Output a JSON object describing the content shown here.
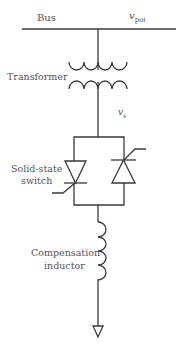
{
  "diagram": {
    "colors": {
      "line": "#3a3a3a",
      "text": "#555555",
      "background": "#ffffff"
    },
    "labels": {
      "bus": "Bus",
      "v_poi_main": "v",
      "v_poi_sub": "poi",
      "transformer": "Transformer",
      "v_s_main": "v",
      "v_s_sub": "s",
      "switch_line1": "Solid-state",
      "switch_line2": "switch",
      "inductor_line1": "Compensation",
      "inductor_line2": "inductor"
    },
    "components": [
      {
        "id": "bus",
        "type": "busbar"
      },
      {
        "id": "transformer",
        "type": "transformer",
        "winding_turns": 4
      },
      {
        "id": "switch",
        "type": "antiparallel-thyristors",
        "count": 2
      },
      {
        "id": "inductor",
        "type": "inductor",
        "turns": 4
      },
      {
        "id": "ground",
        "type": "ground-arrow"
      }
    ]
  }
}
